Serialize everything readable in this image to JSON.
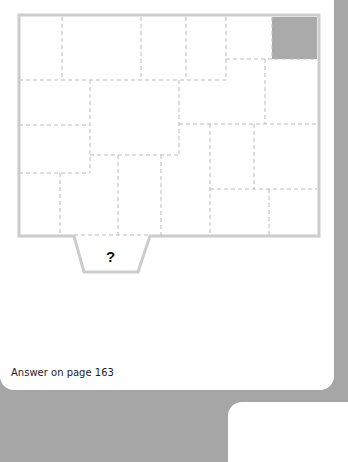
{
  "puzzle": {
    "question_mark": "?",
    "shaded_cell_color": "#aaaaaa",
    "outline_color": "#cccccc",
    "divider_color": "#bbbbbb"
  },
  "footer": {
    "answer_text": "Answer on page 163"
  }
}
